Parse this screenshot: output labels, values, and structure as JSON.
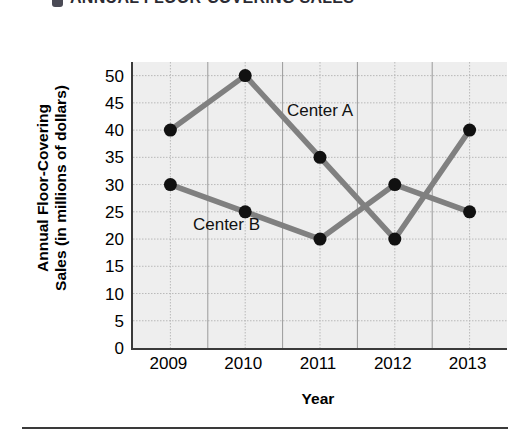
{
  "title": {
    "bullet": "square-bullet-icon",
    "text": "ANNUAL FLOOR-COVERING SALES"
  },
  "chart_data": {
    "type": "line",
    "title": "ANNUAL FLOOR-COVERING SALES",
    "xlabel": "Year",
    "ylabel": "Annual Floor-Covering Sales (in millions of dollars)",
    "ylabel_line1": "Annual Floor-Covering",
    "ylabel_line2": "Sales (in millions of dollars)",
    "categories": [
      "2009",
      "2010",
      "2011",
      "2012",
      "2013"
    ],
    "x": [
      2009,
      2010,
      2011,
      2012,
      2013
    ],
    "series": [
      {
        "name": "Center A",
        "values": [
          40,
          50,
          35,
          20,
          40
        ]
      },
      {
        "name": "Center B",
        "values": [
          30,
          25,
          20,
          30,
          25
        ]
      }
    ],
    "yticks": [
      50,
      45,
      40,
      35,
      30,
      25,
      20,
      15,
      10,
      5,
      0
    ],
    "ylim": [
      0,
      52.5
    ],
    "grid": true,
    "legend_position": "inline-annotations",
    "annotations": [
      {
        "text": "Center A",
        "x": 2011,
        "y": 43.5
      },
      {
        "text": "Center B",
        "x": 2009.75,
        "y": 22.5
      }
    ],
    "colors": {
      "line": "#808080",
      "marker": "#111111",
      "plot_background": "#eeeeee",
      "axis": "#3a3a3a",
      "grid": "#b9b9b9"
    }
  }
}
